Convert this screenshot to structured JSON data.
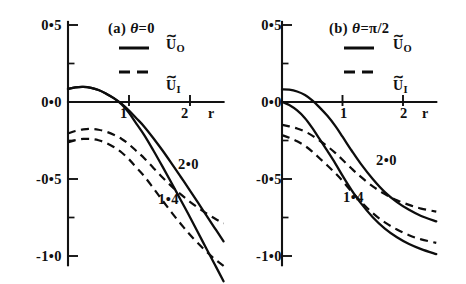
{
  "figure": {
    "background": "#ffffff",
    "ink_color": "#101010",
    "width": 466,
    "height": 284
  },
  "chart_data": [
    {
      "type": "line",
      "panel_id": "a",
      "title": "(a) θ = 0",
      "title_prefix": "(a)",
      "theta_symbol": "θ",
      "theta_value": "=0",
      "xlabel": "r",
      "ylabel": "",
      "xlim": [
        0,
        2.6
      ],
      "ylim": [
        -1.15,
        0.55
      ],
      "xticks": [
        1,
        2
      ],
      "xtick_labels": [
        "1",
        "2"
      ],
      "yticks": [
        0.5,
        0.0,
        -0.5,
        -1.0
      ],
      "ytick_labels": [
        "0.5",
        "0.0",
        "-0.5",
        "-1.0"
      ],
      "yticks_minor": [
        0.25,
        -0.25,
        -0.75
      ],
      "grid": false,
      "legend_position": "upper-right",
      "legend": [
        {
          "label": "Ũ_O",
          "style": "solid"
        },
        {
          "label": "Ũ_I",
          "style": "dashed"
        }
      ],
      "annotations": [
        {
          "text": "2.0",
          "x": 1.82,
          "y": -0.43
        },
        {
          "text": "1.4",
          "x": 1.62,
          "y": -0.62
        }
      ],
      "series": [
        {
          "name": "U_O (2.0)",
          "style": "solid",
          "x": [
            0.0,
            0.12,
            0.25,
            0.38,
            0.5,
            0.62,
            0.75,
            0.88,
            1.0,
            1.12,
            1.25,
            1.4,
            1.55,
            1.7,
            1.85,
            2.0,
            2.2,
            2.4,
            2.55
          ],
          "values": [
            0.085,
            0.095,
            0.098,
            0.092,
            0.078,
            0.055,
            0.025,
            -0.012,
            -0.055,
            -0.105,
            -0.16,
            -0.235,
            -0.315,
            -0.4,
            -0.487,
            -0.575,
            -0.695,
            -0.815,
            -0.905
          ]
        },
        {
          "name": "U_O (1.4)",
          "style": "solid",
          "x": [
            0.0,
            0.12,
            0.25,
            0.38,
            0.5,
            0.62,
            0.75,
            0.88,
            1.0,
            1.12,
            1.25,
            1.4,
            1.55,
            1.7,
            1.85,
            2.0,
            2.2,
            2.4,
            2.55
          ],
          "values": [
            0.085,
            0.095,
            0.098,
            0.092,
            0.078,
            0.055,
            0.025,
            -0.015,
            -0.07,
            -0.14,
            -0.215,
            -0.315,
            -0.42,
            -0.528,
            -0.638,
            -0.748,
            -0.9,
            -1.05,
            -1.165
          ]
        },
        {
          "name": "U_I (2.0)",
          "style": "dashed",
          "x": [
            0.0,
            0.12,
            0.25,
            0.38,
            0.5,
            0.62,
            0.75,
            0.88,
            1.0,
            1.12,
            1.25,
            1.4,
            1.55,
            1.7,
            1.85,
            2.0,
            2.2,
            2.4,
            2.55
          ],
          "values": [
            -0.205,
            -0.188,
            -0.178,
            -0.175,
            -0.18,
            -0.192,
            -0.212,
            -0.24,
            -0.275,
            -0.318,
            -0.365,
            -0.428,
            -0.49,
            -0.548,
            -0.6,
            -0.648,
            -0.705,
            -0.755,
            -0.79
          ]
        },
        {
          "name": "U_I (1.4)",
          "style": "dashed",
          "x": [
            0.0,
            0.12,
            0.25,
            0.38,
            0.5,
            0.62,
            0.75,
            0.88,
            1.0,
            1.12,
            1.25,
            1.4,
            1.55,
            1.7,
            1.85,
            2.0,
            2.2,
            2.4,
            2.55
          ],
          "values": [
            -0.262,
            -0.248,
            -0.24,
            -0.24,
            -0.248,
            -0.265,
            -0.292,
            -0.328,
            -0.372,
            -0.425,
            -0.482,
            -0.56,
            -0.64,
            -0.718,
            -0.792,
            -0.862,
            -0.945,
            -1.018,
            -1.065
          ]
        }
      ]
    },
    {
      "type": "line",
      "panel_id": "b",
      "title": "(b) θ = π/2",
      "title_prefix": "(b)",
      "theta_symbol": "θ",
      "theta_value": "=π/2",
      "xlabel": "r",
      "ylabel": "",
      "xlim": [
        0,
        2.6
      ],
      "ylim": [
        -1.15,
        0.55
      ],
      "xticks": [
        1,
        2
      ],
      "xtick_labels": [
        "1",
        "2"
      ],
      "yticks": [
        0.5,
        0.0,
        -0.5,
        -1.0
      ],
      "ytick_labels": [
        "0.5",
        "0.0",
        "-0.5",
        "-1.0"
      ],
      "yticks_minor": [
        0.25,
        -0.25,
        -0.75
      ],
      "grid": false,
      "legend_position": "upper-right",
      "legend": [
        {
          "label": "Ũ_O",
          "style": "solid"
        },
        {
          "label": "Ũ_I",
          "style": "dashed"
        }
      ],
      "annotations": [
        {
          "text": "2.0",
          "x": 1.58,
          "y": -0.4
        },
        {
          "text": "1.4",
          "x": 1.22,
          "y": -0.6
        }
      ],
      "series": [
        {
          "name": "U_O (2.0)",
          "style": "solid",
          "x": [
            0.0,
            0.12,
            0.25,
            0.38,
            0.5,
            0.62,
            0.75,
            0.88,
            1.0,
            1.15,
            1.3,
            1.5,
            1.7,
            1.9,
            2.1,
            2.3,
            2.55
          ],
          "values": [
            0.082,
            0.08,
            0.068,
            0.045,
            0.01,
            -0.035,
            -0.09,
            -0.155,
            -0.225,
            -0.315,
            -0.4,
            -0.5,
            -0.585,
            -0.65,
            -0.7,
            -0.74,
            -0.775
          ]
        },
        {
          "name": "U_O (1.4)",
          "style": "solid",
          "x": [
            0.0,
            0.12,
            0.25,
            0.38,
            0.5,
            0.62,
            0.75,
            0.88,
            1.0,
            1.15,
            1.3,
            1.5,
            1.7,
            1.9,
            2.1,
            2.3,
            2.55
          ],
          "values": [
            0.002,
            -0.02,
            -0.055,
            -0.105,
            -0.168,
            -0.24,
            -0.318,
            -0.398,
            -0.478,
            -0.572,
            -0.655,
            -0.748,
            -0.822,
            -0.878,
            -0.922,
            -0.955,
            -0.988
          ]
        },
        {
          "name": "U_I (2.0)",
          "style": "dashed",
          "x": [
            0.0,
            0.12,
            0.25,
            0.38,
            0.5,
            0.62,
            0.75,
            0.88,
            1.0,
            1.15,
            1.3,
            1.5,
            1.7,
            1.9,
            2.1,
            2.3,
            2.55
          ],
          "values": [
            -0.148,
            -0.158,
            -0.172,
            -0.192,
            -0.218,
            -0.25,
            -0.288,
            -0.33,
            -0.375,
            -0.432,
            -0.485,
            -0.548,
            -0.598,
            -0.638,
            -0.668,
            -0.692,
            -0.712
          ]
        },
        {
          "name": "U_I (1.4)",
          "style": "dashed",
          "x": [
            0.0,
            0.12,
            0.25,
            0.38,
            0.5,
            0.62,
            0.75,
            0.88,
            1.0,
            1.15,
            1.3,
            1.5,
            1.7,
            1.9,
            2.1,
            2.3,
            2.55
          ],
          "values": [
            -0.215,
            -0.232,
            -0.255,
            -0.285,
            -0.322,
            -0.365,
            -0.412,
            -0.462,
            -0.512,
            -0.582,
            -0.645,
            -0.722,
            -0.782,
            -0.828,
            -0.865,
            -0.892,
            -0.915
          ]
        }
      ]
    }
  ],
  "panel_a": {
    "title_prefix": "(a)",
    "theta": "θ",
    "theta_value": "=0",
    "legend": {
      "solid_label_base": "U",
      "solid_label_sub": "O",
      "dashed_label_base": "U",
      "dashed_label_sub": "I",
      "tilde": "∼"
    },
    "ytick_labels": [
      "0•5",
      "0•0",
      "-0•5",
      "-1•0"
    ],
    "xtick_labels": [
      "1",
      "2"
    ],
    "xaxis_name": "r",
    "annot_upper": "2•0",
    "annot_lower": "1•4"
  },
  "panel_b": {
    "title_prefix": "(b)",
    "theta": "θ",
    "theta_value": "=π/2",
    "legend": {
      "solid_label_base": "U",
      "solid_label_sub": "O",
      "dashed_label_base": "U",
      "dashed_label_sub": "I",
      "tilde": "∼"
    },
    "ytick_labels": [
      "0•5",
      "0•0",
      "-0•5",
      "-1•0"
    ],
    "xtick_labels": [
      "1",
      "2"
    ],
    "xaxis_name": "r",
    "annot_upper": "2•0",
    "annot_lower": "1•4"
  }
}
